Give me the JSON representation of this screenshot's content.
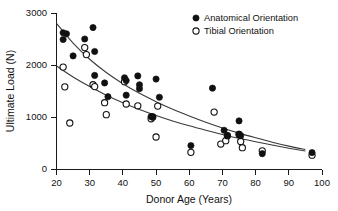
{
  "chart_data": {
    "type": "scatter",
    "title": "",
    "xlabel": "Donor Age (Years)",
    "ylabel": "Ultimate Load (N)",
    "xlim": [
      20,
      100
    ],
    "ylim": [
      0,
      3000
    ],
    "xticks": [
      20,
      30,
      40,
      50,
      60,
      70,
      80,
      90,
      100
    ],
    "yticks": [
      0,
      1000,
      2000,
      3000
    ],
    "grid": false,
    "legend_position": "top-right",
    "series": [
      {
        "name": "Anatomical Orientation",
        "marker": "filled-circle",
        "color": "#111111",
        "points": [
          [
            22,
            2620
          ],
          [
            22,
            2490
          ],
          [
            23,
            2600
          ],
          [
            25,
            2175
          ],
          [
            28.5,
            2500
          ],
          [
            31,
            2720
          ],
          [
            31.5,
            2260
          ],
          [
            31.5,
            1800
          ],
          [
            34.5,
            1655
          ],
          [
            35.5,
            1390
          ],
          [
            40.5,
            1755
          ],
          [
            41,
            1700
          ],
          [
            41,
            1420
          ],
          [
            44.5,
            1790
          ],
          [
            45,
            1620
          ],
          [
            45,
            1545
          ],
          [
            48.5,
            1010
          ],
          [
            49,
            1000
          ],
          [
            50,
            1730
          ],
          [
            51,
            1380
          ],
          [
            60.5,
            450
          ],
          [
            67,
            1555
          ],
          [
            70.5,
            745
          ],
          [
            71.5,
            640
          ],
          [
            75,
            925
          ],
          [
            75,
            670
          ],
          [
            75.5,
            640
          ],
          [
            82,
            295
          ],
          [
            97,
            315
          ]
        ]
      },
      {
        "name": "Tibial Orientation",
        "marker": "open-circle",
        "color": "#ffffff",
        "points": [
          [
            22,
            1960
          ],
          [
            22.5,
            1580
          ],
          [
            24,
            885
          ],
          [
            28.5,
            2335
          ],
          [
            29,
            2200
          ],
          [
            31,
            1620
          ],
          [
            31.5,
            1585
          ],
          [
            34.5,
            1275
          ],
          [
            35,
            1045
          ],
          [
            40.5,
            1680
          ],
          [
            41,
            1250
          ],
          [
            44.5,
            1215
          ],
          [
            48.5,
            965
          ],
          [
            49,
            1000
          ],
          [
            50.5,
            1210
          ],
          [
            50,
            615
          ],
          [
            60.5,
            320
          ],
          [
            67.5,
            1095
          ],
          [
            69.5,
            480
          ],
          [
            71,
            545
          ],
          [
            71.5,
            640
          ],
          [
            75,
            665
          ],
          [
            75.5,
            530
          ],
          [
            76,
            410
          ],
          [
            82,
            350
          ],
          [
            97,
            265
          ]
        ]
      }
    ],
    "fits": [
      {
        "name": "Anatomical Orientation fit",
        "type": "exponential-decay",
        "points": [
          [
            20,
            2800
          ],
          [
            25,
            2420
          ],
          [
            30,
            2110
          ],
          [
            35,
            1855
          ],
          [
            40,
            1640
          ],
          [
            45,
            1455
          ],
          [
            50,
            1295
          ],
          [
            55,
            1150
          ],
          [
            60,
            1020
          ],
          [
            65,
            900
          ],
          [
            70,
            790
          ],
          [
            75,
            690
          ],
          [
            80,
            600
          ],
          [
            85,
            515
          ],
          [
            90,
            440
          ],
          [
            95,
            375
          ],
          [
            100,
            320
          ]
        ]
      },
      {
        "name": "Tibial Orientation fit",
        "type": "exponential-decay",
        "points": [
          [
            20,
            1980
          ],
          [
            25,
            1770
          ],
          [
            30,
            1585
          ],
          [
            35,
            1420
          ],
          [
            40,
            1275
          ],
          [
            45,
            1145
          ],
          [
            50,
            1030
          ],
          [
            55,
            925
          ],
          [
            60,
            830
          ],
          [
            65,
            745
          ],
          [
            70,
            665
          ],
          [
            75,
            590
          ],
          [
            80,
            525
          ],
          [
            85,
            460
          ],
          [
            90,
            400
          ],
          [
            95,
            345
          ],
          [
            100,
            295
          ]
        ]
      }
    ]
  },
  "legend": {
    "items": [
      {
        "label": "Anatomical Orientation",
        "marker": "filled-circle"
      },
      {
        "label": "Tibial Orientation",
        "marker": "open-circle"
      }
    ]
  },
  "axes": {
    "x_title": "Donor Age (Years)",
    "y_title": "Ultimate Load (N)",
    "x_tick_labels": [
      "20",
      "30",
      "40",
      "50",
      "60",
      "70",
      "80",
      "90",
      "100"
    ],
    "y_tick_labels": [
      "0",
      "1000",
      "2000",
      "3000"
    ]
  }
}
